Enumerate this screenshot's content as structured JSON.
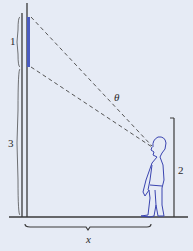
{
  "diagram": {
    "labels": {
      "board_height": "1",
      "board_bottom_height": "3",
      "eye_height": "2",
      "distance": "x",
      "angle": "θ"
    },
    "colors": {
      "background": "#e6ebf5",
      "lines": "#3a3a3a",
      "board": "#4a5bc0",
      "person": "#3a44b0",
      "dashes": "#555555"
    }
  }
}
